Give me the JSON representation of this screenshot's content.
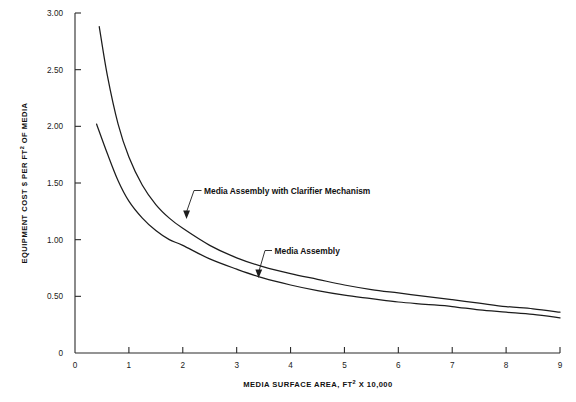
{
  "chart_data": {
    "type": "line",
    "title": "",
    "xlabel": "MEDIA SURFACE AREA, FT² X 10,000",
    "ylabel": "EQUIPMENT COST $ PER FT² OF MEDIA",
    "xlim": [
      0,
      9
    ],
    "ylim": [
      0,
      3.0
    ],
    "grid": false,
    "legend_position": "inline-annotations",
    "x_ticks": [
      0,
      1,
      2,
      3,
      4,
      5,
      6,
      7,
      8,
      9
    ],
    "x_tick_labels": [
      "0",
      "1",
      "2",
      "3",
      "4",
      "5",
      "6",
      "7",
      "8",
      "9"
    ],
    "y_ticks": [
      0,
      0.5,
      1.0,
      1.5,
      2.0,
      2.5,
      3.0
    ],
    "y_tick_labels": [
      "0",
      "0.50",
      "1.00",
      "1.50",
      "2.00",
      "2.50",
      "3.00"
    ],
    "series": [
      {
        "name": "Media Assembly with Clarifier Mechanism",
        "x": [
          0.45,
          0.6,
          0.8,
          1.0,
          1.25,
          1.5,
          1.75,
          2.0,
          2.5,
          3.0,
          3.5,
          4.0,
          4.5,
          5.0,
          5.5,
          6.0,
          6.5,
          7.0,
          7.5,
          8.0,
          8.5,
          9.0
        ],
        "y": [
          2.88,
          2.45,
          2.02,
          1.73,
          1.48,
          1.31,
          1.19,
          1.1,
          0.95,
          0.84,
          0.76,
          0.7,
          0.65,
          0.6,
          0.56,
          0.53,
          0.5,
          0.47,
          0.44,
          0.41,
          0.39,
          0.36
        ]
      },
      {
        "name": "Media Assembly",
        "x": [
          0.4,
          0.6,
          0.8,
          1.0,
          1.25,
          1.5,
          1.75,
          2.0,
          2.5,
          3.0,
          3.5,
          4.0,
          4.5,
          5.0,
          5.5,
          6.0,
          6.5,
          7.0,
          7.5,
          8.0,
          8.5,
          9.0
        ],
        "y": [
          2.02,
          1.76,
          1.52,
          1.34,
          1.19,
          1.08,
          1.0,
          0.95,
          0.83,
          0.74,
          0.66,
          0.6,
          0.55,
          0.51,
          0.48,
          0.45,
          0.43,
          0.41,
          0.38,
          0.36,
          0.34,
          0.31
        ]
      }
    ],
    "annotations": [
      {
        "text": "Media Assembly with Clarifier Mechanism",
        "target_x": 1.95,
        "target_y": 1.18
      },
      {
        "text": "Media Assembly",
        "target_x": 3.35,
        "target_y": 0.7
      }
    ]
  },
  "axis": {
    "y_title_prefix": "EQUIPMENT COST $ PER FT",
    "y_title_sup": "2",
    "y_title_suffix": " OF MEDIA",
    "x_title_prefix": "MEDIA SURFACE AREA, FT",
    "x_title_sup": "2",
    "x_title_suffix": " X 10,000"
  },
  "colors": {
    "curve": "#1c1c1c",
    "axis": "#2b2b2b",
    "background": "#ffffff",
    "text": "#1a1a1a"
  }
}
